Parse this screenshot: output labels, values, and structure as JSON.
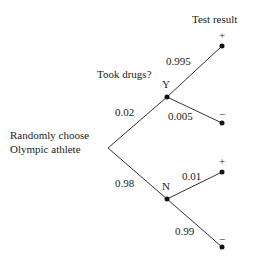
{
  "diagram": {
    "type": "probability-tree",
    "column_headers": {
      "stage1": "Took drugs?",
      "stage2": "Test result"
    },
    "root": {
      "label_line1": "Randomly choose",
      "label_line2": "Olympic athlete"
    },
    "branches": {
      "yes": {
        "node_label": "Y",
        "probability": "0.02",
        "children": {
          "positive": {
            "sign": "+",
            "probability": "0.995"
          },
          "negative": {
            "sign": "−",
            "probability": "0.005"
          }
        }
      },
      "no": {
        "node_label": "N",
        "probability": "0.98",
        "children": {
          "positive": {
            "sign": "+",
            "probability": "0.01"
          },
          "negative": {
            "sign": "−",
            "probability": "0.99"
          }
        }
      }
    },
    "colors": {
      "line": "#333333",
      "node": "#111111",
      "text": "#1a1a1a",
      "background": "#ffffff"
    }
  }
}
